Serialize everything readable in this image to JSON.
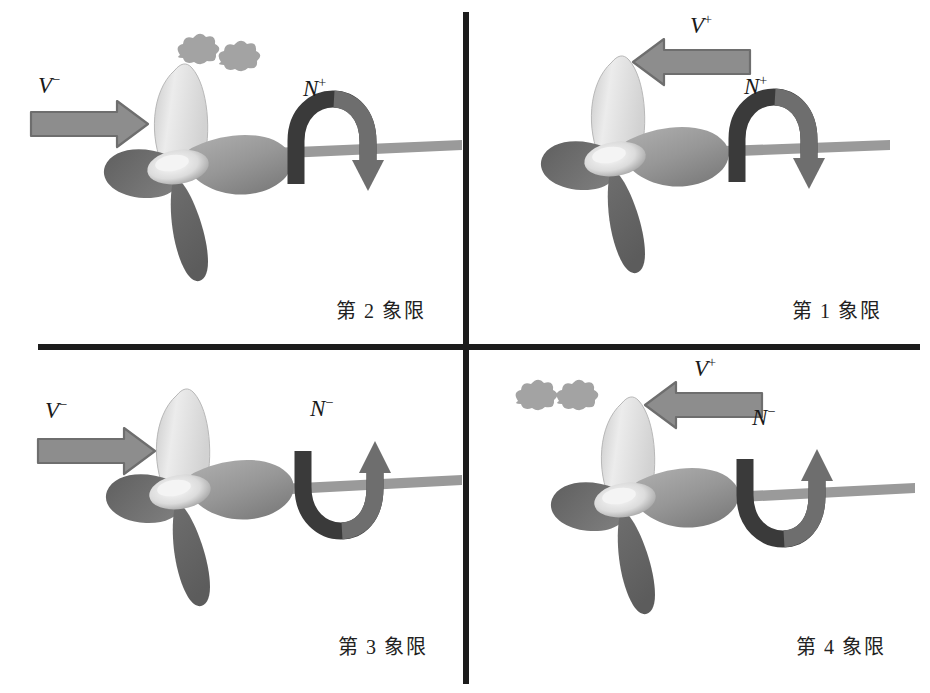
{
  "figure": {
    "background_color": "#ffffff",
    "divider_color": "#1c1c1c",
    "width": 930,
    "height": 693
  },
  "palette": {
    "arrow_gray": "#8a8a8a",
    "arrow_gray_outline": "#6f6f6f",
    "moment_arrow_dark": "#2c2c2c",
    "moment_arrow_mid": "#6b6b6b",
    "shaft_gray": "#9a9a9a",
    "blade_light": "#e6e6e6",
    "blade_mid": "#9b9b9b",
    "blade_dark": "#6a6a6a",
    "hub_highlight": "#f2f2f2",
    "bubble_gray": "#a6a6a6",
    "text_color": "#1a1a1a"
  },
  "quadrants": [
    {
      "id": "q2",
      "position": "top-left",
      "caption": "第 2 象限",
      "velocity": {
        "symbol": "V",
        "sign": "−",
        "label_base": "V",
        "direction": "right"
      },
      "moment": {
        "symbol": "N",
        "sign": "+",
        "label_base": "N",
        "rotation": "over-the-top-clockwise",
        "arrowhead": "down"
      },
      "cavitation_bubbles": 2
    },
    {
      "id": "q1",
      "position": "top-right",
      "caption": "第 1 象限",
      "velocity": {
        "symbol": "V",
        "sign": "+",
        "label_base": "V",
        "direction": "left"
      },
      "moment": {
        "symbol": "N",
        "sign": "+",
        "label_base": "N",
        "rotation": "over-the-top-clockwise",
        "arrowhead": "down"
      },
      "cavitation_bubbles": 0
    },
    {
      "id": "q3",
      "position": "bottom-left",
      "caption": "第 3 象限",
      "velocity": {
        "symbol": "V",
        "sign": "−",
        "label_base": "V",
        "direction": "right"
      },
      "moment": {
        "symbol": "N",
        "sign": "−",
        "label_base": "N",
        "rotation": "under-the-bottom-counterclockwise",
        "arrowhead": "up"
      },
      "cavitation_bubbles": 0
    },
    {
      "id": "q4",
      "position": "bottom-right",
      "caption": "第 4 象限",
      "velocity": {
        "symbol": "V",
        "sign": "+",
        "label_base": "V",
        "direction": "left"
      },
      "moment": {
        "symbol": "N",
        "sign": "−",
        "label_base": "N",
        "rotation": "under-the-bottom-counterclockwise",
        "arrowhead": "up"
      },
      "cavitation_bubbles": 2
    }
  ]
}
